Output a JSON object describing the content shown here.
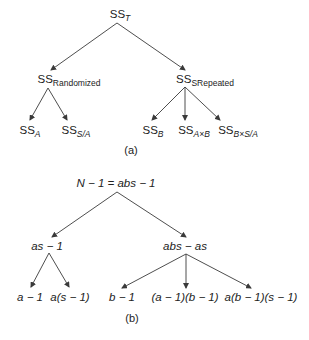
{
  "diagram_a": {
    "caption": "(a)",
    "root": {
      "base": "SS",
      "sub": "T"
    },
    "level1": [
      {
        "base": "SS",
        "sub": "Randomized"
      },
      {
        "base": "SS",
        "sub": "SRepeated"
      }
    ],
    "level2_left": [
      {
        "base": "SS",
        "sub": "A"
      },
      {
        "base": "SS",
        "sub": "S/A"
      }
    ],
    "level2_right": [
      {
        "base": "SS",
        "sub": "B"
      },
      {
        "base": "SS",
        "sub": "A×B"
      },
      {
        "base": "SS",
        "sub": "B×S/A"
      }
    ]
  },
  "diagram_b": {
    "caption": "(b)",
    "root": "N − 1 = abs − 1",
    "level1": [
      "as − 1",
      "abs − as"
    ],
    "level2_left": [
      "a − 1",
      "a(s − 1)"
    ],
    "level2_right": [
      "b − 1",
      "(a − 1)(b − 1)",
      "a(b − 1)(s − 1)"
    ]
  },
  "colors": {
    "line": "#3a3a3a",
    "text": "#222222"
  }
}
